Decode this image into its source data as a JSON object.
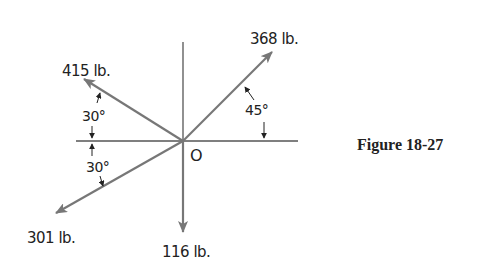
{
  "figure": {
    "caption": "Figure 18-27",
    "origin_label": "O",
    "forces": [
      {
        "id": "f368",
        "label": "368 lb.",
        "magnitude": 368,
        "unit": "lb.",
        "angle_deg": 45,
        "direction": "up-right"
      },
      {
        "id": "f415",
        "label": "415 lb.",
        "magnitude": 415,
        "unit": "lb.",
        "angle_deg": 150,
        "direction": "up-left"
      },
      {
        "id": "f301",
        "label": "301 lb.",
        "magnitude": 301,
        "unit": "lb.",
        "angle_deg": 210,
        "direction": "down-left"
      },
      {
        "id": "f116",
        "label": "116 lb.",
        "magnitude": 116,
        "unit": "lb.",
        "angle_deg": 270,
        "direction": "down"
      }
    ],
    "angles": [
      {
        "label": "45°",
        "between": "368 lb. and positive x-axis"
      },
      {
        "label": "30°",
        "between": "415 lb. and negative x-axis"
      },
      {
        "label": "30°",
        "between": "301 lb. and negative x-axis"
      }
    ],
    "colors": {
      "force_arrow": "#777777",
      "axis": "#555555",
      "text": "#222222"
    }
  }
}
